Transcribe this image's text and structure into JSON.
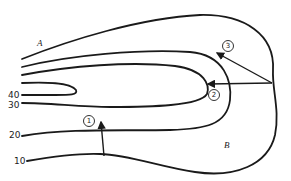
{
  "diagram": {
    "type": "isoline map (contour lines with flow arrows)",
    "regions": {
      "A": "A",
      "B": "B"
    },
    "contour_labels": [
      "40",
      "30",
      "20",
      "10"
    ],
    "arrow_labels": [
      "1",
      "2",
      "3"
    ],
    "colors": {
      "line": "#1a1a1a",
      "background": "#ffffff"
    }
  }
}
